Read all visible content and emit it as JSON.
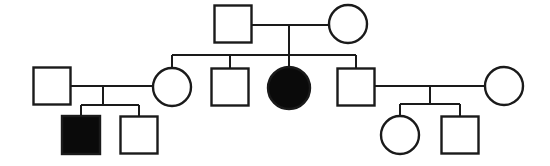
{
  "diagram": {
    "type": "pedigree",
    "canvas": {
      "width": 550,
      "height": 166
    },
    "colors": {
      "background": "#ffffff",
      "stroke": "#1a1a1a",
      "unaffected_fill": "#ffffff",
      "affected_fill": "#0a0a0a"
    },
    "legend": {
      "square_meaning": "male",
      "circle_meaning": "female",
      "filled_meaning": "affected",
      "open_meaning": "unaffected"
    },
    "generations": [
      {
        "id": "generation-1",
        "label": "I",
        "members": [
          {
            "id": "I-1",
            "shape": "square",
            "sex": "male",
            "status": "unaffected",
            "cx": 233,
            "cy": 24,
            "size": 37
          },
          {
            "id": "I-2",
            "shape": "circle",
            "sex": "female",
            "status": "unaffected",
            "cx": 348,
            "cy": 24,
            "size": 38
          }
        ]
      },
      {
        "id": "generation-2",
        "label": "II",
        "members": [
          {
            "id": "II-1",
            "shape": "square",
            "sex": "male",
            "status": "unaffected",
            "cx": 52,
            "cy": 86,
            "size": 37
          },
          {
            "id": "II-2",
            "shape": "circle",
            "sex": "female",
            "status": "unaffected",
            "cx": 172,
            "cy": 87,
            "size": 38
          },
          {
            "id": "II-3",
            "shape": "square",
            "sex": "male",
            "status": "unaffected",
            "cx": 230,
            "cy": 87,
            "size": 37
          },
          {
            "id": "II-4",
            "shape": "circle",
            "sex": "female",
            "status": "affected",
            "cx": 289,
            "cy": 88,
            "size": 42
          },
          {
            "id": "II-5",
            "shape": "square",
            "sex": "male",
            "status": "unaffected",
            "cx": 356,
            "cy": 87,
            "size": 37
          },
          {
            "id": "II-6",
            "shape": "circle",
            "sex": "female",
            "status": "unaffected",
            "cx": 504,
            "cy": 86,
            "size": 38
          }
        ]
      },
      {
        "id": "generation-3",
        "label": "III",
        "members": [
          {
            "id": "III-1",
            "shape": "square",
            "sex": "male",
            "status": "affected",
            "cx": 81,
            "cy": 135,
            "size": 38
          },
          {
            "id": "III-2",
            "shape": "square",
            "sex": "male",
            "status": "unaffected",
            "cx": 139,
            "cy": 135,
            "size": 37
          },
          {
            "id": "III-3",
            "shape": "circle",
            "sex": "female",
            "status": "unaffected",
            "cx": 400,
            "cy": 135,
            "size": 38
          },
          {
            "id": "III-4",
            "shape": "square",
            "sex": "male",
            "status": "unaffected",
            "cx": 460,
            "cy": 135,
            "size": 37
          }
        ]
      }
    ],
    "matings": [
      {
        "id": "mating-I1-I2",
        "partners": [
          "I-1",
          "I-2"
        ],
        "y": 25,
        "x1": 252,
        "x2": 329,
        "descent_x": 289
      },
      {
        "id": "mating-II1-II2",
        "partners": [
          "II-1",
          "II-2"
        ],
        "y": 86,
        "x1": 71,
        "x2": 153,
        "descent_x": 103
      },
      {
        "id": "mating-II5-II6",
        "partners": [
          "II-5",
          "II-6"
        ],
        "y": 86,
        "x1": 375,
        "x2": 485,
        "descent_x": 430
      }
    ],
    "sibships": [
      {
        "id": "sibship-generation-2",
        "parents": "mating-I1-I2",
        "bar_y": 55,
        "bar_x1": 172,
        "bar_x2": 356,
        "children": [
          "II-2",
          "II-3",
          "II-4",
          "II-5"
        ],
        "drop_xs": [
          172,
          230,
          289,
          356
        ]
      },
      {
        "id": "sibship-generation-3-left",
        "parents": "mating-II1-II2",
        "bar_y": 105,
        "bar_x1": 81,
        "bar_x2": 139,
        "children": [
          "III-1",
          "III-2"
        ],
        "drop_xs": [
          81,
          139
        ]
      },
      {
        "id": "sibship-generation-3-right",
        "parents": "mating-II5-II6",
        "bar_y": 104,
        "bar_x1": 400,
        "bar_x2": 460,
        "children": [
          "III-3",
          "III-4"
        ],
        "drop_xs": [
          400,
          460
        ]
      }
    ]
  }
}
